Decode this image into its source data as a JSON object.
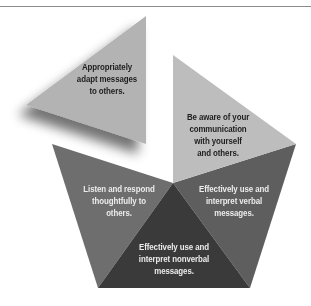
{
  "diagram": {
    "title": "",
    "type": "exploded-pentagon",
    "segments": [
      {
        "id": "adapt",
        "lines": [
          "Appropriately",
          "adapt messages",
          "to others."
        ],
        "color": "#b3b3b3",
        "text_color": "#1e1e1e",
        "exploded": true
      },
      {
        "id": "aware",
        "lines": [
          "Be aware of your",
          "communication",
          "with yourself",
          "and others."
        ],
        "color": "#bdbdbd",
        "text_color": "#1e1e1e",
        "exploded": false
      },
      {
        "id": "verbal",
        "lines": [
          "Effectively use and",
          "interpret verbal",
          "messages."
        ],
        "color": "#5e5e5e",
        "text_color": "#ececec",
        "exploded": false
      },
      {
        "id": "nonverbal",
        "lines": [
          "Effectively use and",
          "interpret nonverbal",
          "messages."
        ],
        "color": "#3a3a3a",
        "text_color": "#ececec",
        "exploded": false
      },
      {
        "id": "listen",
        "lines": [
          "Listen and respond",
          "thoughtfully to",
          "others."
        ],
        "color": "#6e6e6e",
        "text_color": "#ececec",
        "exploded": false
      }
    ]
  }
}
